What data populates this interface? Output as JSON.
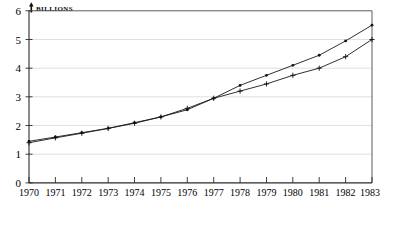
{
  "chart_data": {
    "type": "line",
    "title": "",
    "ylabel": "BILLIONS",
    "xlabel": "",
    "ylim": [
      0,
      6
    ],
    "yticks": [
      0,
      1,
      2,
      3,
      4,
      5,
      6
    ],
    "ytick_labels": [
      "0",
      "1",
      "2",
      "3",
      "4",
      "5",
      "6"
    ],
    "grid": true,
    "legend_position": "none",
    "x": [
      1970,
      1971,
      1972,
      1973,
      1974,
      1975,
      1976,
      1977,
      1978,
      1979,
      1980,
      1981,
      1982,
      1983
    ],
    "xtick_labels": [
      "1970",
      "1971",
      "1972",
      "1973",
      "1974",
      "1975",
      "1976",
      "1977",
      "1978",
      "1979",
      "1980",
      "1981",
      "1982",
      "1983"
    ],
    "series": [
      {
        "name": "upper-series",
        "marker": "dot",
        "values": [
          1.45,
          1.6,
          1.75,
          1.9,
          2.1,
          2.3,
          2.55,
          2.95,
          3.4,
          3.75,
          4.1,
          4.45,
          4.95,
          5.5
        ]
      },
      {
        "name": "lower-series",
        "marker": "plus",
        "values": [
          1.4,
          1.57,
          1.73,
          1.9,
          2.08,
          2.3,
          2.6,
          2.95,
          3.2,
          3.45,
          3.75,
          4.0,
          4.4,
          5.0
        ]
      }
    ]
  },
  "axis": {
    "y_title_text": "BILLIONS",
    "y_title_marker": "arrow-up-icon"
  }
}
